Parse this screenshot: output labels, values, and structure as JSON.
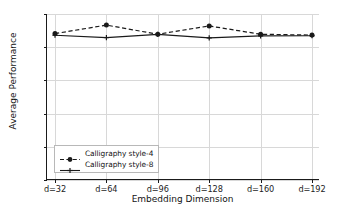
{
  "chart_data": {
    "type": "line",
    "title": "",
    "xlabel": "Embedding Dimension",
    "ylabel": "Average Performance",
    "categories": [
      "d=32",
      "d=64",
      "d=96",
      "d=128",
      "d=160",
      "d=192"
    ],
    "series": [
      {
        "name": "Calligraphy style-4",
        "values": [
          0.9882,
          0.9933,
          0.9878,
          0.9928,
          0.9878,
          0.9873
        ],
        "linestyle": "dashed",
        "marker": "circle",
        "color": "#1a1a1a"
      },
      {
        "name": "Calligraphy style-8",
        "values": [
          0.9872,
          0.9858,
          0.9877,
          0.9856,
          0.9868,
          0.9869
        ],
        "linestyle": "solid",
        "marker": "plus",
        "color": "#1a1a1a"
      }
    ],
    "ylim": [
      0.9,
      1.0
    ],
    "yticks": [
      0.9,
      0.92,
      0.94,
      0.96,
      0.98,
      1.0
    ],
    "ytick_labels": [
      "0.90",
      "0.92",
      "0.94",
      "0.96",
      "0.98",
      "1.00"
    ],
    "grid": true,
    "grid_color": "#d8d8d8",
    "legend_position": "lower left",
    "background": "#ffffff",
    "axis_color": "#1a1a1a"
  }
}
